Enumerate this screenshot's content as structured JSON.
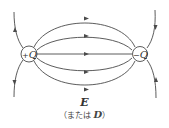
{
  "diagram": {
    "positive_charge": {
      "sign": "+",
      "symbol": "Q"
    },
    "negative_charge": {
      "sign": "−",
      "symbol": "Q"
    },
    "caption": {
      "main": "E",
      "sub_prefix": "（または ",
      "sub_symbol": "D",
      "sub_suffix": "）"
    },
    "colors": {
      "line": "#4a4a4a",
      "text": "#333333",
      "background": "#ffffff"
    }
  }
}
